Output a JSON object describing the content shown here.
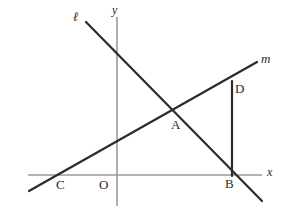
{
  "figure": {
    "width": 290,
    "height": 215,
    "background_color": "#ffffff",
    "axis_color": "#9a9a9a",
    "line_color": "#2b2b2b",
    "label_color": "#2b2b2b"
  },
  "axes": {
    "x_label": "x",
    "y_label": "y",
    "origin_label": "O",
    "x_axis": {
      "x1": 28,
      "y1": 175,
      "x2": 262,
      "y2": 175
    },
    "y_axis": {
      "x1": 117,
      "y1": 17,
      "x2": 117,
      "y2": 206
    },
    "x_label_pos": {
      "x": 267,
      "y": 166
    },
    "y_label_pos": {
      "x": 112,
      "y": 4
    },
    "origin_label_pos": {
      "x": 99,
      "y": 178
    }
  },
  "lines": [
    {
      "name": "line-l",
      "label": "ℓ",
      "label_pos": {
        "x": 73,
        "y": 10
      },
      "x1": 86,
      "y1": 22,
      "x2": 262,
      "y2": 201,
      "stroke_width": 2.2
    },
    {
      "name": "line-m",
      "label": "m",
      "label_pos": {
        "x": 261,
        "y": 52
      },
      "x1": 29,
      "y1": 191,
      "x2": 257,
      "y2": 62,
      "stroke_width": 2.2
    }
  ],
  "segments": [
    {
      "name": "segment-db",
      "from": "D",
      "to": "B",
      "x1": 232,
      "y1": 81,
      "x2": 232,
      "y2": 176,
      "stroke_width": 2.2
    }
  ],
  "points": [
    {
      "label": "A",
      "x": 172,
      "y": 110,
      "label_pos": {
        "x": 171,
        "y": 118
      }
    },
    {
      "label": "B",
      "x": 232,
      "y": 175,
      "label_pos": {
        "x": 225,
        "y": 177
      }
    },
    {
      "label": "C",
      "x": 56,
      "y": 175,
      "label_pos": {
        "x": 56,
        "y": 178
      }
    },
    {
      "label": "D",
      "x": 232,
      "y": 81,
      "label_pos": {
        "x": 235,
        "y": 82
      }
    }
  ],
  "chart_data": {
    "type": "scatter",
    "title": "",
    "xlabel": "x",
    "ylabel": "y",
    "grid": false,
    "legend": "none",
    "annotations": [
      "ℓ",
      "m",
      "A",
      "B",
      "C",
      "D",
      "O",
      "x",
      "y"
    ],
    "series": [
      {
        "name": "ℓ",
        "description": "Line l, negative slope, passes through A and B",
        "points": [
          [
            86,
            22
          ],
          [
            172,
            110
          ],
          [
            232,
            175
          ],
          [
            262,
            201
          ]
        ]
      },
      {
        "name": "m",
        "description": "Line m, positive slope, passes through C, A and D",
        "points": [
          [
            29,
            191
          ],
          [
            56,
            175
          ],
          [
            172,
            110
          ],
          [
            232,
            81
          ],
          [
            257,
            62
          ]
        ]
      },
      {
        "name": "DB",
        "description": "Vertical segment from D down to B on the x-axis",
        "points": [
          [
            232,
            81
          ],
          [
            232,
            175
          ]
        ]
      }
    ]
  }
}
